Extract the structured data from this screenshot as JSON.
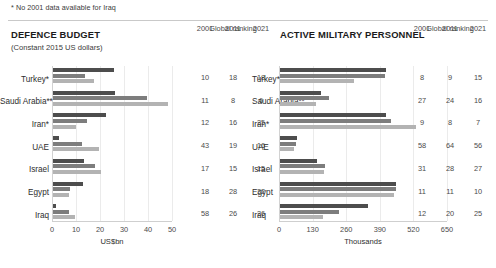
{
  "footnote": "* No 2001 data available for Iraq",
  "rank_header_label": "Global ranking",
  "years": [
    "2001",
    "2011",
    "2021"
  ],
  "panels": {
    "defence": {
      "title": "DEFENCE BUDGET",
      "subtitle": "(Constant 2015 US dollars)",
      "axis_title": "US$bn"
    },
    "personnel": {
      "title": "ACTIVE MILITARY PERSONNEL",
      "axis_title": "Thousands"
    }
  },
  "chart_data": [
    {
      "type": "bar",
      "title": "DEFENCE BUDGET",
      "subtitle": "(Constant 2015 US dollars)",
      "orientation": "horizontal",
      "xlabel": "US$bn",
      "ylabel": "",
      "xlim": [
        0,
        50
      ],
      "xticks": [
        0,
        10,
        20,
        30,
        40,
        50
      ],
      "grid": true,
      "legend": "none",
      "categories": [
        "Turkey*",
        "Saudi Arabia**",
        "Iran*",
        "UAE",
        "Israel",
        "Egypt",
        "Iraq"
      ],
      "series": [
        {
          "name": "2001",
          "color": "#4d4d4d",
          "values": [
            25.5,
            26.0,
            22.0,
            2.5,
            13.0,
            12.5,
            1.2
          ]
        },
        {
          "name": "2011",
          "color": "#7d7d7d",
          "values": [
            13.5,
            39.0,
            14.0,
            12.0,
            17.5,
            7.0,
            6.5
          ]
        },
        {
          "name": "2021",
          "color": "#b3b3b3",
          "values": [
            17.0,
            48.0,
            9.5,
            19.0,
            20.0,
            6.5,
            9.0
          ]
        }
      ],
      "rankings": {
        "label": "Global ranking",
        "columns": [
          "2001",
          "2011",
          "2021"
        ],
        "rows": [
          {
            "category": "Turkey*",
            "values": [
              "10",
              "18",
              "18"
            ]
          },
          {
            "category": "Saudi Arabia**",
            "values": [
              "11",
              "8",
              "6"
            ]
          },
          {
            "category": "Iran*",
            "values": [
              "12",
              "16",
              "25"
            ]
          },
          {
            "category": "UAE",
            "values": [
              "43",
              "19",
              "16"
            ]
          },
          {
            "category": "Israel",
            "values": [
              "17",
              "15",
              "15"
            ]
          },
          {
            "category": "Egypt",
            "values": [
              "18",
              "28",
              "32"
            ]
          },
          {
            "category": "Iraq",
            "values": [
              "58",
              "26",
              "26"
            ]
          }
        ]
      }
    },
    {
      "type": "bar",
      "title": "ACTIVE MILITARY PERSONNEL",
      "subtitle": "",
      "orientation": "horizontal",
      "xlabel": "Thousands",
      "ylabel": "",
      "xlim": [
        0,
        650
      ],
      "xticks": [
        0,
        130,
        260,
        390,
        520,
        650
      ],
      "grid": true,
      "legend": "none",
      "categories": [
        "Turkey*",
        "Saudi Arabia**",
        "Iran*",
        "UAE",
        "Israel",
        "Egypt",
        "Iraq"
      ],
      "series": [
        {
          "name": "2001",
          "color": "#4d4d4d",
          "values": [
            410,
            160,
            410,
            65,
            145,
            450,
            340
          ]
        },
        {
          "name": "2011",
          "color": "#7d7d7d",
          "values": [
            405,
            190,
            430,
            60,
            175,
            450,
            230
          ]
        },
        {
          "name": "2021",
          "color": "#b3b3b3",
          "values": [
            285,
            140,
            525,
            55,
            170,
            440,
            165
          ]
        }
      ],
      "rankings": {
        "label": "Global ranking",
        "columns": [
          "2001",
          "2011",
          "2021"
        ],
        "rows": [
          {
            "category": "Turkey*",
            "values": [
              "8",
              "9",
              "15"
            ]
          },
          {
            "category": "Saudi Arabia**",
            "values": [
              "27",
              "24",
              "16"
            ]
          },
          {
            "category": "Iran*",
            "values": [
              "9",
              "8",
              "7"
            ]
          },
          {
            "category": "UAE",
            "values": [
              "58",
              "64",
              "56"
            ]
          },
          {
            "category": "Israel",
            "values": [
              "31",
              "28",
              "27"
            ]
          },
          {
            "category": "Egypt",
            "values": [
              "11",
              "11",
              "10"
            ]
          },
          {
            "category": "Iraq",
            "values": [
              "12",
              "20",
              "25"
            ]
          }
        ]
      }
    }
  ]
}
